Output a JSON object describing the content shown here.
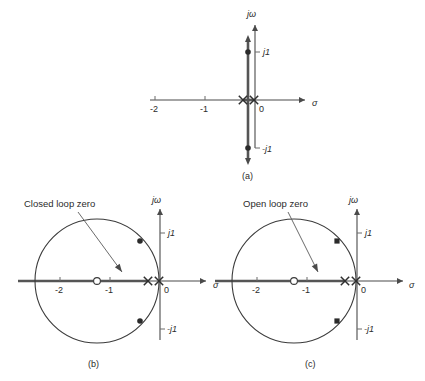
{
  "figure": {
    "background": "#ffffff",
    "ink_color": "#2b2b2b",
    "axis_color": "#4a4a4a",
    "panels": [
      {
        "id": "a",
        "caption": "(a)",
        "caption_pos": {
          "x": 242,
          "y": 179
        },
        "origin": {
          "x": 255,
          "y": 100
        },
        "unit_px": 50,
        "real_axis": {
          "label": "σ",
          "label_pos": {
            "x": 312,
            "y": 106
          },
          "x_from": 150,
          "x_to": 305,
          "arrow": "right"
        },
        "imag_axis": {
          "label": "jω",
          "label_pos": {
            "x": 247,
            "y": 17
          },
          "y_from": 148,
          "y_to": 25,
          "arrow": "up"
        },
        "ticks": [
          {
            "label": "-2",
            "x": 155,
            "y": 100,
            "text_pos": {
              "x": 150,
              "y": 112
            }
          },
          {
            "label": "-1",
            "x": 205,
            "y": 100,
            "text_pos": {
              "x": 200,
              "y": 112
            }
          },
          {
            "label": "0",
            "x": 255,
            "y": 100,
            "text_pos": {
              "x": 259,
              "y": 112
            }
          }
        ],
        "imag_ticks": [
          {
            "label": "j1",
            "x": 255,
            "y": 52,
            "text_pos": {
              "x": 263,
              "y": 55
            }
          },
          {
            "label": "-j1",
            "x": 255,
            "y": 148,
            "text_pos": {
              "x": 262,
              "y": 152
            }
          }
        ],
        "poles": [
          {
            "x": 243,
            "y": 100,
            "type": "x"
          },
          {
            "x": 254,
            "y": 100,
            "type": "x"
          }
        ],
        "locus_vertical": {
          "x": 248,
          "y_top": 40,
          "y_bottom": 160
        },
        "locus_points": [
          {
            "x": 248,
            "y": 52,
            "type": "dot"
          },
          {
            "x": 248,
            "y": 148,
            "type": "dot"
          }
        ],
        "real_segment": {
          "x_from": 243,
          "x_to": 254,
          "y": 100
        }
      },
      {
        "id": "b",
        "caption": "(b)",
        "caption_pos": {
          "x": 88,
          "y": 367
        },
        "origin": {
          "x": 160,
          "y": 281
        },
        "unit_px": 50,
        "note": {
          "text": "Closed loop zero",
          "x": 24,
          "y": 207
        },
        "leader": {
          "x1": 78,
          "y1": 212,
          "x2": 122,
          "y2": 272
        },
        "real_axis": {
          "label": "σ",
          "label_pos": {
            "x": 213,
            "y": 288
          },
          "x_from": 18,
          "x_to": 206,
          "arrow": "right"
        },
        "imag_axis": {
          "label": "jω",
          "label_pos": {
            "x": 152,
            "y": 203
          },
          "y_from": 340,
          "y_to": 209,
          "arrow": "up"
        },
        "ticks": [
          {
            "label": "-2",
            "x": 60,
            "y": 281,
            "text_pos": {
              "x": 55,
              "y": 293
            }
          },
          {
            "label": "-1",
            "x": 110,
            "y": 281,
            "text_pos": {
              "x": 105,
              "y": 293
            }
          },
          {
            "label": "0",
            "x": 160,
            "y": 281,
            "text_pos": {
              "x": 164,
              "y": 293
            }
          }
        ],
        "imag_ticks": [
          {
            "label": "j1",
            "x": 160,
            "y": 233,
            "text_pos": {
              "x": 168,
              "y": 236
            }
          },
          {
            "label": "-j1",
            "x": 160,
            "y": 329,
            "text_pos": {
              "x": 167,
              "y": 332
            }
          }
        ],
        "poles": [
          {
            "x": 148,
            "y": 281,
            "type": "x"
          },
          {
            "x": 159,
            "y": 281,
            "type": "x"
          }
        ],
        "zero": {
          "x": 97,
          "y": 281,
          "type": "o"
        },
        "circle": {
          "cx": 97,
          "cy": 281,
          "r": 62
        },
        "locus_points": [
          {
            "x": 140,
            "y": 241,
            "type": "dot"
          },
          {
            "x": 140,
            "y": 321,
            "type": "dot"
          }
        ],
        "real_segment": {
          "x_from": 18,
          "x_to": 148,
          "y": 281
        }
      },
      {
        "id": "c",
        "caption": "(c)",
        "caption_pos": {
          "x": 305,
          "y": 367
        },
        "origin": {
          "x": 357,
          "y": 281
        },
        "unit_px": 50,
        "note": {
          "text": "Open loop zero",
          "x": 243,
          "y": 207
        },
        "leader": {
          "x1": 288,
          "y1": 212,
          "x2": 318,
          "y2": 272
        },
        "real_axis": {
          "label": "σ",
          "label_pos": {
            "x": 409,
            "y": 288
          },
          "x_from": 215,
          "x_to": 403,
          "arrow": "right"
        },
        "imag_axis": {
          "label": "jω",
          "label_pos": {
            "x": 349,
            "y": 203
          },
          "y_from": 340,
          "y_to": 209,
          "arrow": "up"
        },
        "ticks": [
          {
            "label": "-2",
            "x": 257,
            "y": 281,
            "text_pos": {
              "x": 252,
              "y": 293
            }
          },
          {
            "label": "-1",
            "x": 307,
            "y": 281,
            "text_pos": {
              "x": 302,
              "y": 293
            }
          },
          {
            "label": "0",
            "x": 357,
            "y": 281,
            "text_pos": {
              "x": 361,
              "y": 293
            }
          }
        ],
        "imag_ticks": [
          {
            "label": "j1",
            "x": 357,
            "y": 233,
            "text_pos": {
              "x": 365,
              "y": 236
            }
          },
          {
            "label": "-j1",
            "x": 357,
            "y": 329,
            "text_pos": {
              "x": 364,
              "y": 332
            }
          }
        ],
        "poles": [
          {
            "x": 345,
            "y": 281,
            "type": "x"
          },
          {
            "x": 356,
            "y": 281,
            "type": "x"
          }
        ],
        "zero": {
          "x": 294,
          "y": 281,
          "type": "o"
        },
        "circle": {
          "cx": 294,
          "cy": 281,
          "r": 62
        },
        "locus_points": [
          {
            "x": 337,
            "y": 241,
            "type": "sq"
          },
          {
            "x": 337,
            "y": 321,
            "type": "sq"
          }
        ],
        "real_segment": {
          "x_from": 215,
          "x_to": 345,
          "y": 281
        }
      }
    ]
  },
  "chart_data": {
    "type": "scatter",
    "xlabel": "σ",
    "ylabel": "jω",
    "panels": [
      {
        "name": "(a)",
        "xlim": [
          -2.5,
          1.0
        ],
        "ylim": [
          -1.6,
          1.6
        ],
        "xticks": [
          -2,
          -1,
          0
        ],
        "yticks": [
          -1,
          1
        ],
        "ytick_labels": [
          "-j1",
          "j1"
        ],
        "poles": [
          [
            -0.24,
            0
          ],
          [
            0,
            0
          ]
        ],
        "zeros": [],
        "locus_branches": [
          {
            "description": "vertical line at sigma = -0.14",
            "x": -0.14,
            "y_range": [
              -1.2,
              1.2
            ]
          }
        ],
        "marked_points": [
          [
            -0.14,
            1.0
          ],
          [
            -0.14,
            -1.0
          ]
        ]
      },
      {
        "name": "(b)",
        "xlim": [
          -2.9,
          1.0
        ],
        "ylim": [
          -1.6,
          1.6
        ],
        "xticks": [
          -2,
          -1,
          0
        ],
        "yticks": [
          -1,
          1
        ],
        "ytick_labels": [
          "-j1",
          "j1"
        ],
        "poles": [
          [
            -0.24,
            0
          ],
          [
            0,
            0
          ]
        ],
        "zeros": [
          [
            -1.26,
            0
          ]
        ],
        "annotation": "Closed loop zero",
        "locus_branches": [
          {
            "description": "circle centered at zero",
            "center": [
              -1.26,
              0
            ],
            "radius": 1.24
          }
        ],
        "marked_points": [
          [
            -0.4,
            0.8
          ],
          [
            -0.4,
            -0.8
          ]
        ]
      },
      {
        "name": "(c)",
        "xlim": [
          -2.9,
          1.0
        ],
        "ylim": [
          -1.6,
          1.6
        ],
        "xticks": [
          -2,
          -1,
          0
        ],
        "yticks": [
          -1,
          1
        ],
        "ytick_labels": [
          "-j1",
          "j1"
        ],
        "poles": [
          [
            -0.24,
            0
          ],
          [
            0,
            0
          ]
        ],
        "zeros": [
          [
            -1.26,
            0
          ]
        ],
        "annotation": "Open loop zero",
        "locus_branches": [
          {
            "description": "circle centered at zero",
            "center": [
              -1.26,
              0
            ],
            "radius": 1.24
          }
        ],
        "marked_points": [
          [
            -0.4,
            0.8
          ],
          [
            -0.4,
            -0.8
          ]
        ]
      }
    ]
  }
}
